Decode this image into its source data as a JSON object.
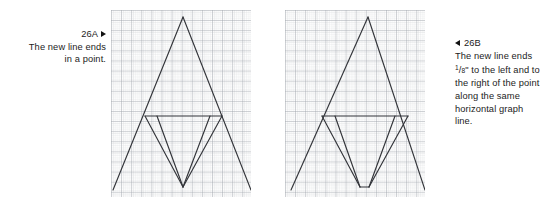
{
  "figure": {
    "panels": [
      {
        "id": "26A",
        "caption": {
          "number": "26A",
          "arrow_icon": "triangle-right-icon",
          "arrow_side": "right",
          "lines": [
            "The new line ends",
            "in a point."
          ],
          "align": "right"
        },
        "graph": {
          "grid": {
            "minor_spacing_px": 2,
            "major_spacing_px": 10,
            "minor_color": "#d2d4d8",
            "major_color": "#9a9ea6",
            "background": "#ffffff"
          },
          "line_color": "#33353a",
          "line_width": 1.2,
          "paths": [
            {
              "name": "outer-left-leg",
              "points": "72,7 2,180"
            },
            {
              "name": "outer-right-leg",
              "points": "72,7 140,180"
            },
            {
              "name": "crossbar",
              "points": "34,106 111,106"
            },
            {
              "name": "inner-left-leg",
              "points": "34,106 72,177"
            },
            {
              "name": "inner-right-leg",
              "points": "111,106 72,177"
            },
            {
              "name": "inner-left-leg-2",
              "points": "46,106 72,177"
            },
            {
              "name": "inner-right-leg-2",
              "points": "99,106 72,177"
            }
          ],
          "bottom_vertex": {
            "type": "point",
            "x": 72,
            "y": 177
          }
        }
      },
      {
        "id": "26B",
        "caption": {
          "number": "26B",
          "arrow_icon": "triangle-left-icon",
          "arrow_side": "left",
          "lines": [
            "The new line ends",
            "FRACTION_LINE",
            "the right of the point",
            "along the same",
            "horizontal graph",
            "line."
          ],
          "fraction_line": {
            "numerator": "1",
            "denominator": "8",
            "unit": "\"",
            "suffix": " to the left and to"
          },
          "align": "left"
        },
        "graph": {
          "grid": {
            "minor_spacing_px": 2,
            "major_spacing_px": 10,
            "minor_color": "#d2d4d8",
            "major_color": "#9a9ea6",
            "background": "#ffffff"
          },
          "line_color": "#33353a",
          "line_width": 1.2,
          "paths": [
            {
              "name": "outer-left-leg",
              "points": "83,7 6,180"
            },
            {
              "name": "outer-right-leg",
              "points": "83,7 140,180"
            },
            {
              "name": "crossbar",
              "points": "37,106 123,106"
            },
            {
              "name": "inner-left-leg",
              "points": "37,106 75,177"
            },
            {
              "name": "inner-right-leg",
              "points": "123,106 84,177"
            },
            {
              "name": "inner-left-leg-2",
              "points": "50,106 75,177"
            },
            {
              "name": "inner-right-leg-2",
              "points": "110,106 84,177"
            },
            {
              "name": "bottom-flat",
              "points": "75,177 84,177"
            }
          ],
          "bottom_vertex": {
            "type": "flat-segment",
            "x1": 75,
            "x2": 84,
            "y": 177
          }
        }
      }
    ]
  },
  "colors": {
    "text": "#1c1c1c",
    "arrow": "#111111",
    "line": "#33353a",
    "grid_minor": "#d2d4d8",
    "grid_major": "#9a9ea6",
    "page_background": "#ffffff"
  }
}
